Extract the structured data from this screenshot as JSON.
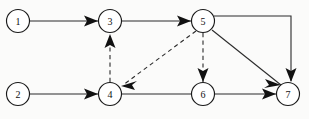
{
  "diagram": {
    "type": "directed-graph",
    "canvas": {
      "width": 309,
      "height": 119,
      "background": "#fbfbfa"
    },
    "style": {
      "node_fill": "#ffffff",
      "node_stroke": "#1a1a1a",
      "edge_color": "#2b2b2b",
      "arrow_color": "#111111",
      "node_radius": 11.5
    },
    "nodes": [
      {
        "id": "1",
        "label": "1",
        "cx": 18,
        "cy": 21,
        "r": 11.5
      },
      {
        "id": "2",
        "label": "2",
        "cx": 18,
        "cy": 94,
        "r": 11.5
      },
      {
        "id": "3",
        "label": "3",
        "cx": 110,
        "cy": 21,
        "r": 11.5
      },
      {
        "id": "4",
        "label": "4",
        "cx": 110,
        "cy": 94,
        "r": 11.5
      },
      {
        "id": "5",
        "label": "5",
        "cx": 203,
        "cy": 21,
        "r": 11.5
      },
      {
        "id": "6",
        "label": "6",
        "cx": 203,
        "cy": 94,
        "r": 11.5
      },
      {
        "id": "7",
        "label": "7",
        "cx": 288,
        "cy": 94,
        "r": 11.5
      }
    ],
    "edges": [
      {
        "id": "e1-3",
        "from": "1",
        "to": "3",
        "style": "solid",
        "arrow": true,
        "shape": "line",
        "x1": 30,
        "y1": 21,
        "x2": 98,
        "y2": 21
      },
      {
        "id": "e3-5",
        "from": "3",
        "to": "5",
        "style": "solid",
        "arrow": true,
        "shape": "line",
        "x1": 122,
        "y1": 21,
        "x2": 191,
        "y2": 21
      },
      {
        "id": "e2-4",
        "from": "2",
        "to": "4",
        "style": "solid",
        "arrow": true,
        "shape": "line",
        "x1": 30,
        "y1": 94,
        "x2": 98,
        "y2": 94
      },
      {
        "id": "e4-6",
        "from": "4",
        "to": "6",
        "style": "solid",
        "arrow": false,
        "shape": "line",
        "x1": 122,
        "y1": 94,
        "x2": 191,
        "y2": 94
      },
      {
        "id": "e6-7",
        "from": "6",
        "to": "7",
        "style": "solid",
        "arrow": true,
        "shape": "line",
        "x1": 215,
        "y1": 94,
        "x2": 276,
        "y2": 94
      },
      {
        "id": "e5-7-diag",
        "from": "5",
        "to": "7",
        "style": "solid",
        "arrow": true,
        "shape": "line",
        "x1": 212,
        "y1": 30,
        "x2": 280,
        "y2": 85
      },
      {
        "id": "e5-7-elbow",
        "from": "5",
        "to": "7",
        "style": "solid",
        "arrow": true,
        "shape": "elbow",
        "path": "M 214 16 L 291 16 L 291 80"
      },
      {
        "id": "e4-3",
        "from": "4",
        "to": "3",
        "style": "dashed",
        "arrow": true,
        "shape": "line",
        "x1": 110,
        "y1": 82,
        "x2": 110,
        "y2": 35
      },
      {
        "id": "e5-4",
        "from": "5",
        "to": "4",
        "style": "dashed",
        "arrow": true,
        "shape": "line",
        "x1": 195,
        "y1": 31,
        "x2": 122,
        "y2": 85
      },
      {
        "id": "e5-6",
        "from": "5",
        "to": "6",
        "style": "dashed",
        "arrow": true,
        "shape": "line",
        "x1": 203,
        "y1": 33,
        "x2": 203,
        "y2": 80
      }
    ],
    "arrowheads": [
      {
        "id": "a1-3",
        "for": "e1-3",
        "tip_x": 98,
        "tip_y": 21,
        "angle": 0
      },
      {
        "id": "a3-5",
        "for": "e3-5",
        "tip_x": 191,
        "tip_y": 21,
        "angle": 0
      },
      {
        "id": "a2-4",
        "for": "e2-4",
        "tip_x": 98,
        "tip_y": 94,
        "angle": 0
      },
      {
        "id": "a6-7",
        "for": "e6-7",
        "tip_x": 276,
        "tip_y": 94,
        "angle": 0
      },
      {
        "id": "a5-7-diag",
        "for": "e5-7-diag",
        "tip_x": 280,
        "tip_y": 85,
        "angle": 39
      },
      {
        "id": "a5-7-elbow",
        "for": "e5-7-elbow",
        "tip_x": 291,
        "tip_y": 81,
        "angle": 90
      },
      {
        "id": "a4-3",
        "for": "e4-3",
        "tip_x": 110,
        "tip_y": 34,
        "angle": -90
      },
      {
        "id": "a5-4",
        "for": "e5-4",
        "tip_x": 121,
        "tip_y": 86,
        "angle": 144
      },
      {
        "id": "a5-6",
        "for": "e5-6",
        "tip_x": 203,
        "tip_y": 81,
        "angle": 90
      }
    ]
  }
}
